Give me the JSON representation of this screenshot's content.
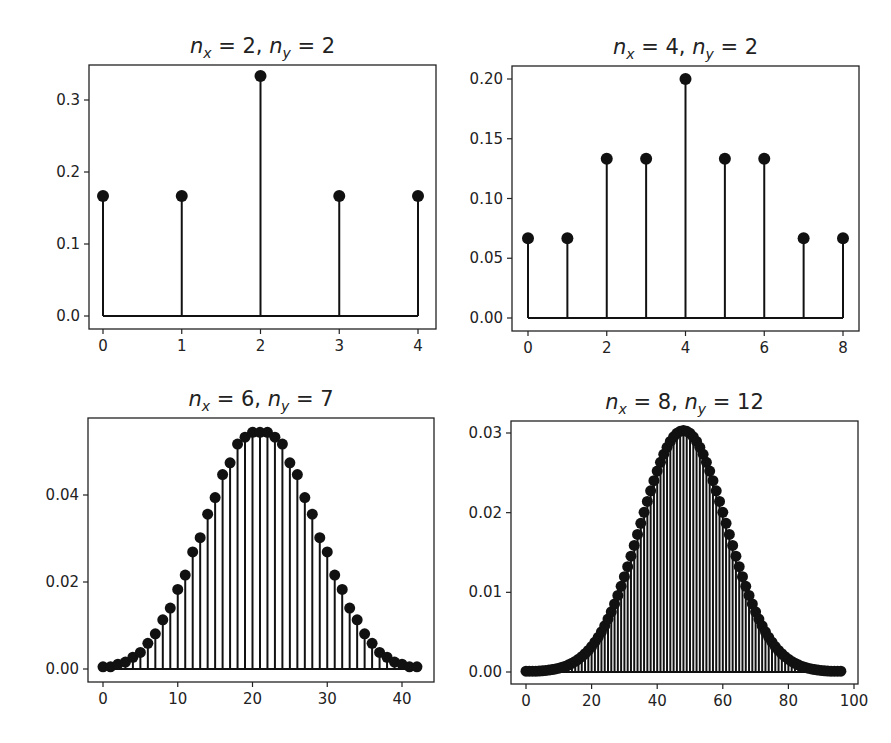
{
  "figure": {
    "width": 891,
    "height": 743,
    "background": "#ffffff",
    "ink": "#111111"
  },
  "chart_data": [
    {
      "type": "stem",
      "title": "n_x = 2, n_y = 2",
      "title_parts": {
        "nx": "2",
        "ny": "2"
      },
      "xlabel": "",
      "ylabel": "",
      "frame": {
        "left": 89,
        "top": 65,
        "right": 436,
        "bottom": 329
      },
      "xlim_px": {
        "v0": 0,
        "p0": 103,
        "v1": 4,
        "p1": 418
      },
      "ylim_px": {
        "v0": 0.0,
        "p0": 316,
        "v1": 0.3,
        "p1": 100
      },
      "xticks": [
        0,
        1,
        2,
        3,
        4
      ],
      "xtick_labels": [
        "0",
        "1",
        "2",
        "3",
        "4"
      ],
      "yticks": [
        0.0,
        0.1,
        0.2,
        0.3
      ],
      "ytick_labels": [
        "0.0",
        "0.1",
        "0.2",
        "0.3"
      ],
      "x": [
        0,
        1,
        2,
        3,
        4
      ],
      "values": [
        0.1667,
        0.1667,
        0.3333,
        0.1667,
        0.1667
      ],
      "marker_r": 6
    },
    {
      "type": "stem",
      "title": "n_x = 4, n_y = 2",
      "title_parts": {
        "nx": "4",
        "ny": "2"
      },
      "xlabel": "",
      "ylabel": "",
      "frame": {
        "left": 512,
        "top": 66,
        "right": 859,
        "bottom": 331
      },
      "xlim_px": {
        "v0": 0,
        "p0": 528,
        "v1": 8,
        "p1": 843
      },
      "ylim_px": {
        "v0": 0.0,
        "p0": 318,
        "v1": 0.2,
        "p1": 79
      },
      "xticks": [
        0,
        2,
        4,
        6,
        8
      ],
      "xtick_labels": [
        "0",
        "2",
        "4",
        "6",
        "8"
      ],
      "yticks": [
        0.0,
        0.05,
        0.1,
        0.15,
        0.2
      ],
      "ytick_labels": [
        "0.00",
        "0.05",
        "0.10",
        "0.15",
        "0.20"
      ],
      "x": [
        0,
        1,
        2,
        3,
        4,
        5,
        6,
        7,
        8
      ],
      "values": [
        0.0667,
        0.0667,
        0.1333,
        0.1333,
        0.2,
        0.1333,
        0.1333,
        0.0667,
        0.0667
      ],
      "marker_r": 6
    },
    {
      "type": "stem",
      "title": "n_x = 6, n_y = 7",
      "title_parts": {
        "nx": "6",
        "ny": "7"
      },
      "xlabel": "",
      "ylabel": "",
      "frame": {
        "left": 88,
        "top": 418,
        "right": 434,
        "bottom": 682
      },
      "xlim_px": {
        "v0": 0,
        "p0": 103,
        "v1": 40,
        "p1": 402
      },
      "ylim_px": {
        "v0": 0.0,
        "p0": 669,
        "v1": 0.04,
        "p1": 495
      },
      "xticks": [
        0,
        10,
        20,
        30,
        40
      ],
      "xtick_labels": [
        "0",
        "10",
        "20",
        "30",
        "40"
      ],
      "yticks": [
        0.0,
        0.02,
        0.04
      ],
      "ytick_labels": [
        "0.00",
        "0.02",
        "0.04"
      ],
      "x_range": [
        0,
        42
      ],
      "values": [
        0.0005,
        0.0005,
        0.0011,
        0.0016,
        0.0027,
        0.0038,
        0.0059,
        0.0081,
        0.0113,
        0.014,
        0.0183,
        0.0216,
        0.0269,
        0.0302,
        0.0356,
        0.0394,
        0.0447,
        0.0474,
        0.0517,
        0.0533,
        0.0544,
        0.0544,
        0.0544,
        0.0533,
        0.0517,
        0.0474,
        0.0447,
        0.0394,
        0.0356,
        0.0302,
        0.0269,
        0.0216,
        0.0183,
        0.014,
        0.0113,
        0.0081,
        0.0059,
        0.0038,
        0.0027,
        0.0016,
        0.0011,
        0.0005,
        0.0005
      ],
      "marker_r": 5.5
    },
    {
      "type": "stem",
      "title": "n_x = 8, n_y = 12",
      "title_parts": {
        "nx": "8",
        "ny": "12"
      },
      "xlabel": "",
      "ylabel": "",
      "frame": {
        "left": 511,
        "top": 421,
        "right": 858,
        "bottom": 684
      },
      "xlim_px": {
        "v0": 0,
        "p0": 526,
        "v1": 100,
        "p1": 854
      },
      "ylim_px": {
        "v0": 0.0,
        "p0": 672,
        "v1": 0.03,
        "p1": 433
      },
      "xticks": [
        0,
        20,
        40,
        60,
        80,
        100
      ],
      "xtick_labels": [
        "0",
        "20",
        "40",
        "60",
        "80",
        "100"
      ],
      "yticks": [
        0.0,
        0.01,
        0.02,
        0.03
      ],
      "ytick_labels": [
        "0.00",
        "0.01",
        "0.02",
        "0.03"
      ],
      "x_range": [
        0,
        96
      ],
      "gaussian_approx": {
        "peak": 0.0303,
        "center": 48,
        "sigma": 13.2,
        "floor": 0.0001
      },
      "marker_r": 5.5
    }
  ]
}
